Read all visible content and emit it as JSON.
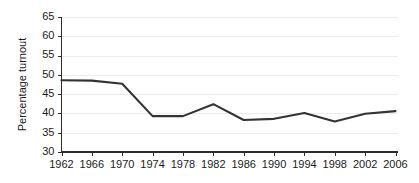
{
  "chart_data": {
    "type": "line",
    "title": "",
    "subtitle": "",
    "xlabel": "",
    "ylabel": "Percentage turnout",
    "categories": [
      "1962",
      "1966",
      "1970",
      "1974",
      "1978",
      "1982",
      "1986",
      "1990",
      "1994",
      "1998",
      "2002",
      "2006"
    ],
    "x": [
      1962,
      1966,
      1970,
      1974,
      1978,
      1982,
      1986,
      1990,
      1994,
      1998,
      2002,
      2006
    ],
    "values": [
      48.6,
      48.5,
      47.7,
      39.3,
      39.3,
      42.4,
      38.3,
      38.6,
      40.1,
      37.9,
      39.9,
      40.6
    ],
    "series": [
      {
        "name": "Percentage turnout",
        "values": [
          48.6,
          48.5,
          47.7,
          39.3,
          39.3,
          42.4,
          38.3,
          38.6,
          40.1,
          37.9,
          39.9,
          40.6
        ]
      }
    ],
    "ylim": [
      30,
      65
    ],
    "yticks": [
      30,
      35,
      40,
      45,
      50,
      55,
      60,
      65
    ],
    "ytick_labels": [
      "30",
      "35",
      "40",
      "45",
      "50",
      "55",
      "60",
      "65"
    ],
    "xlim": [
      1962,
      2006
    ],
    "xticks": [
      1962,
      1966,
      1970,
      1974,
      1978,
      1982,
      1986,
      1990,
      1994,
      1998,
      2002,
      2006
    ],
    "xtick_labels": [
      "1962",
      "1966",
      "1970",
      "1974",
      "1978",
      "1982",
      "1986",
      "1990",
      "1994",
      "1998",
      "2002",
      "2006"
    ],
    "grid": true,
    "grid_axis": "y",
    "legend": false,
    "legend_position": "none",
    "line_color": "#333333",
    "grid_color": "#ececec",
    "axis_color": "#2b2b2b",
    "background_color": "#ffffff",
    "annotations": []
  }
}
